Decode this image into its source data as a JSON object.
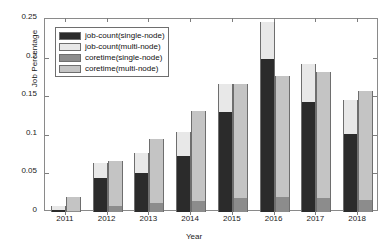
{
  "chart_data": {
    "type": "bar",
    "title": "",
    "xlabel": "Year",
    "ylabel": "Job Percentage",
    "categories": [
      "2011",
      "2012",
      "2013",
      "2014",
      "2015",
      "2016",
      "2017",
      "2018"
    ],
    "ylim": [
      0,
      0.25
    ],
    "yticks": [
      0,
      0.05,
      0.1,
      0.15,
      0.2,
      0.25
    ],
    "ytick_labels": [
      "0",
      "0.05",
      "0.1",
      "0.15",
      "0.2",
      "0.25"
    ],
    "grid": false,
    "legend_position": "upper left",
    "bar_style": "grouped-stacked",
    "groups": [
      {
        "name": "job-count",
        "segments": [
          "job-count(single-node)",
          "job-count(multi-node)"
        ]
      },
      {
        "name": "coretime",
        "segments": [
          "coretime(single-node)",
          "coretime(multi-node)"
        ]
      }
    ],
    "series": [
      {
        "name": "job-count(single-node)",
        "color": "#2b2b2b",
        "stack": "job-count",
        "values": [
          0.002,
          0.044,
          0.051,
          0.072,
          0.13,
          0.198,
          0.142,
          0.101
        ]
      },
      {
        "name": "job-count(multi-node)",
        "color": "#e8e8e8",
        "stack": "job-count",
        "values": [
          0.006,
          0.02,
          0.026,
          0.032,
          0.036,
          0.048,
          0.05,
          0.044
        ]
      },
      {
        "name": "coretime(single-node)",
        "color": "#8c8c8c",
        "stack": "coretime",
        "values": [
          0.001,
          0.008,
          0.011,
          0.014,
          0.018,
          0.02,
          0.018,
          0.016
        ]
      },
      {
        "name": "coretime(multi-node)",
        "color": "#c4c4c4",
        "stack": "coretime",
        "values": [
          0.018,
          0.058,
          0.083,
          0.117,
          0.148,
          0.156,
          0.163,
          0.141
        ]
      }
    ],
    "totals": {
      "job-count": [
        0.008,
        0.064,
        0.077,
        0.104,
        0.166,
        0.246,
        0.192,
        0.145
      ],
      "coretime": [
        0.019,
        0.066,
        0.094,
        0.131,
        0.166,
        0.176,
        0.181,
        0.157
      ]
    }
  },
  "legend": {
    "entries": [
      {
        "label": "job-count(single-node)",
        "color": "#2b2b2b"
      },
      {
        "label": "job-count(multi-node)",
        "color": "#e8e8e8"
      },
      {
        "label": "coretime(single-node)",
        "color": "#8c8c8c"
      },
      {
        "label": "coretime(multi-node)",
        "color": "#c4c4c4"
      }
    ]
  },
  "axes": {
    "y_label": "Job Percentage",
    "x_label": "Year"
  },
  "colors": {
    "axis": "#8a8a8a",
    "text": "#1a1a1a",
    "background": "#ffffff",
    "bar_edge": "#6e6e6e"
  }
}
